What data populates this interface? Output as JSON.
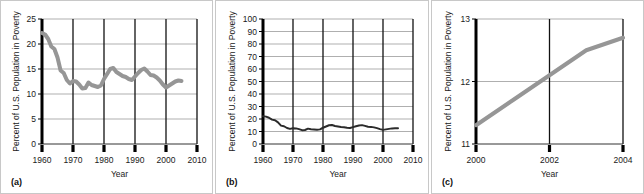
{
  "figure": {
    "background": "#ffffff",
    "panel_border_color": "#c8c8c8",
    "series_color_gray": "#969696",
    "series_color_dark": "#2b2b2b",
    "gridline_color": "#8c8c8c",
    "axis_color": "#000000"
  },
  "panels": [
    {
      "tag": "(a)",
      "chart_data": {
        "type": "line",
        "title": "",
        "xlabel": "Year",
        "ylabel": "Percent of U.S. Population in Poverty",
        "xlim": [
          1960,
          2010
        ],
        "ylim": [
          0,
          25
        ],
        "xticks": [
          1960,
          1970,
          1980,
          1990,
          2000,
          2010
        ],
        "yticks": [
          0,
          5,
          10,
          15,
          20,
          25
        ],
        "xtick_labels": [
          "1960",
          "1970",
          "1980",
          "1990",
          "2000",
          "2010"
        ],
        "ytick_labels": [
          "0",
          "5",
          "10",
          "15",
          "20",
          "25"
        ],
        "grid": true,
        "legend": "none",
        "series": [
          {
            "name": "U.S. poverty rate",
            "color": "#969696",
            "linewidth": 4,
            "x": [
              1960,
              1961,
              1962,
              1963,
              1964,
              1965,
              1966,
              1967,
              1968,
              1969,
              1970,
              1971,
              1972,
              1973,
              1974,
              1975,
              1976,
              1977,
              1978,
              1979,
              1980,
              1981,
              1982,
              1983,
              1984,
              1985,
              1986,
              1987,
              1988,
              1989,
              1990,
              1991,
              1992,
              1993,
              1994,
              1995,
              1996,
              1997,
              1998,
              1999,
              2000,
              2001,
              2002,
              2003,
              2004,
              2005
            ],
            "values": [
              22.2,
              21.9,
              21.0,
              19.5,
              19.0,
              17.3,
              14.7,
              14.2,
              12.8,
              12.1,
              12.6,
              12.5,
              11.9,
              11.1,
              11.2,
              12.3,
              11.8,
              11.6,
              11.4,
              11.7,
              13.0,
              14.0,
              15.0,
              15.2,
              14.4,
              14.0,
              13.6,
              13.4,
              13.0,
              12.8,
              13.5,
              14.2,
              14.8,
              15.1,
              14.5,
              13.8,
              13.7,
              13.3,
              12.7,
              11.9,
              11.3,
              11.7,
              12.1,
              12.5,
              12.7,
              12.6
            ]
          }
        ]
      }
    },
    {
      "tag": "(b)",
      "chart_data": {
        "type": "line",
        "title": "",
        "xlabel": "Year",
        "ylabel": "Percent of U.S. Population in Poverty",
        "xlim": [
          1960,
          2010
        ],
        "ylim": [
          0,
          100
        ],
        "xticks": [
          1960,
          1970,
          1980,
          1990,
          2000,
          2010
        ],
        "yticks": [
          0,
          10,
          20,
          30,
          40,
          50,
          60,
          70,
          80,
          90,
          100
        ],
        "xtick_labels": [
          "1960",
          "1970",
          "1980",
          "1990",
          "2000",
          "2010"
        ],
        "ytick_labels": [
          "0",
          "10",
          "20",
          "30",
          "40",
          "50",
          "60",
          "70",
          "80",
          "90",
          "100"
        ],
        "grid": true,
        "legend": "none",
        "series": [
          {
            "name": "U.S. poverty rate",
            "color": "#2b2b2b",
            "linewidth": 2,
            "x": [
              1960,
              1961,
              1962,
              1963,
              1964,
              1965,
              1966,
              1967,
              1968,
              1969,
              1970,
              1971,
              1972,
              1973,
              1974,
              1975,
              1976,
              1977,
              1978,
              1979,
              1980,
              1981,
              1982,
              1983,
              1984,
              1985,
              1986,
              1987,
              1988,
              1989,
              1990,
              1991,
              1992,
              1993,
              1994,
              1995,
              1996,
              1997,
              1998,
              1999,
              2000,
              2001,
              2002,
              2003,
              2004,
              2005
            ],
            "values": [
              22.2,
              21.9,
              21.0,
              19.5,
              19.0,
              17.3,
              14.7,
              14.2,
              12.8,
              12.1,
              12.6,
              12.5,
              11.9,
              11.1,
              11.2,
              12.3,
              11.8,
              11.6,
              11.4,
              11.7,
              13.0,
              14.0,
              15.0,
              15.2,
              14.4,
              14.0,
              13.6,
              13.4,
              13.0,
              12.8,
              13.5,
              14.2,
              14.8,
              15.1,
              14.5,
              13.8,
              13.7,
              13.3,
              12.7,
              11.9,
              11.3,
              11.7,
              12.1,
              12.5,
              12.7,
              12.6
            ]
          }
        ]
      }
    },
    {
      "tag": "(c)",
      "chart_data": {
        "type": "line",
        "title": "",
        "xlabel": "Year",
        "ylabel": "Percent of U.S. Population in Poverty",
        "xlim": [
          2000,
          2004
        ],
        "ylim": [
          11,
          13
        ],
        "xticks": [
          2000,
          2002,
          2004
        ],
        "yticks": [
          11,
          12,
          13
        ],
        "xtick_labels": [
          "2000",
          "2002",
          "2004"
        ],
        "ytick_labels": [
          "11",
          "12",
          "13"
        ],
        "grid": true,
        "legend": "none",
        "series": [
          {
            "name": "U.S. poverty rate",
            "color": "#969696",
            "linewidth": 4,
            "x": [
              2000,
              2001,
              2002,
              2003,
              2004
            ],
            "values": [
              11.3,
              11.7,
              12.1,
              12.5,
              12.7
            ]
          }
        ]
      }
    }
  ]
}
